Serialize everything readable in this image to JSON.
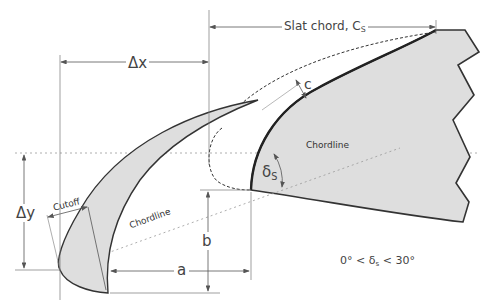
{
  "diagram": {
    "labels": {
      "slat_chord": "Slat chord, C",
      "slat_chord_sub": "S",
      "delta_x": "Δx",
      "delta_y": "Δy",
      "gap": "c",
      "chordline_main": "Chordline",
      "chordline_slat": "Chordline",
      "cutoff": "Cutoff",
      "delta_s": "δ",
      "delta_s_sub": "S",
      "dim_a": "a",
      "dim_b": "b",
      "range_prefix": "0° < δ",
      "range_sub": "s",
      "range_suffix": " < 30°"
    },
    "colors": {
      "fill": "#dedede",
      "outline": "#333333",
      "dim_line": "#666666",
      "dotted": "#999999"
    }
  }
}
